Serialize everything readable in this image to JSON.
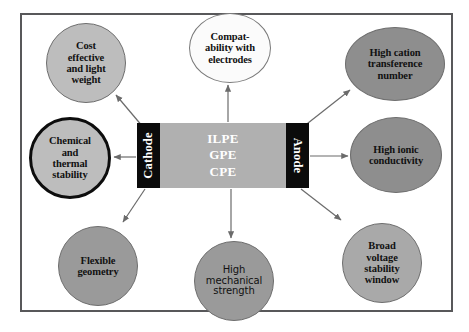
{
  "diagram": {
    "frame": {
      "border_color": "#58585a"
    },
    "cell": {
      "cathode_label": "Cathode",
      "anode_label": "Anode",
      "electrode_bg": "#0b0b0b",
      "electrode_text_color": "#ffffff",
      "membrane_bg": "#b0b0b0",
      "membrane_text_color": "#ffffff",
      "membrane_lines": [
        "ILPE",
        "GPE",
        "CPE"
      ],
      "membrane_line_1": "ILPE",
      "membrane_line_2": "GPE",
      "membrane_line_3": "CPE"
    },
    "nodes": [
      {
        "id": "cost-effective",
        "label": "Cost effective and light weight",
        "fill": "#bdbdbd",
        "stroke": "#6e6e6e",
        "shape": "circle"
      },
      {
        "id": "compatability",
        "label": "Compat- ability with electrodes",
        "fill": "#fbfbfb",
        "stroke": "#7a7a7a",
        "shape": "ellipse"
      },
      {
        "id": "cation-transfer",
        "label": "High cation transference number",
        "fill": "#8e8e8e",
        "stroke": "#6e6e6e",
        "shape": "ellipse"
      },
      {
        "id": "chemical-thermal",
        "label": "Chemical and thermal stability",
        "fill": "#bdbdbd",
        "stroke": "#0d0d0d",
        "shape": "circle"
      },
      {
        "id": "ionic-conduct",
        "label": "High ionic conductivity",
        "fill": "#8e8e8e",
        "stroke": "#6e6e6e",
        "shape": "ellipse"
      },
      {
        "id": "flexible-geo",
        "label": "Flexible geometry",
        "fill": "#9a9a9a",
        "stroke": "#6e6e6e",
        "shape": "circle"
      },
      {
        "id": "mech-strength",
        "label": "High mechanical strength",
        "fill": "#9a9a9a",
        "stroke": "#6e6e6e",
        "shape": "circle"
      },
      {
        "id": "broad-voltage",
        "label": "Broad voltage stability window",
        "fill": "#a9a9a9",
        "stroke": "#6e6e6e",
        "shape": "circle"
      }
    ],
    "node_labels": {
      "cost_effective": {
        "l1": "Cost",
        "l2": "effective",
        "l3": "and light",
        "l4": "weight"
      },
      "compatability": {
        "l1": "Compat-",
        "l2": "ability with",
        "l3": "electrodes"
      },
      "cation_transfer": {
        "l1": "High cation",
        "l2": "transference",
        "l3": "number"
      },
      "chemical_thermal": {
        "l1": "Chemical",
        "l2": "and",
        "l3": "thermal",
        "l4": "stability"
      },
      "ionic_conduct": {
        "l1": "High ionic",
        "l2": "conductivity"
      },
      "flexible_geo": {
        "l1": "Flexible",
        "l2": "geometry"
      },
      "mech_strength": {
        "l1": "High",
        "l2": "mechanical",
        "l3": "strength"
      },
      "broad_voltage": {
        "l1": "Broad",
        "l2": "voltage",
        "l3": "stability",
        "l4": "window"
      }
    },
    "arrows": {
      "count": 8,
      "color": "#6b6b6b",
      "direction": "outward from cell block to each property node"
    }
  }
}
